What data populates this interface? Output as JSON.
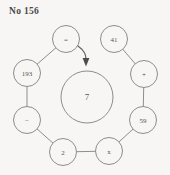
{
  "title": "No 156",
  "puzzle": {
    "center": {
      "label": "7",
      "cx": 87,
      "cy": 97,
      "r": 26
    },
    "nodes": [
      {
        "id": "equals",
        "label": "=",
        "cx": 66,
        "cy": 39,
        "r": 13.5
      },
      {
        "id": "n41",
        "label": "41",
        "cx": 114,
        "cy": 39,
        "r": 13.5
      },
      {
        "id": "plus",
        "label": "+",
        "cx": 144,
        "cy": 74,
        "r": 13.5
      },
      {
        "id": "n59",
        "label": "59",
        "cx": 143,
        "cy": 120,
        "r": 13.5
      },
      {
        "id": "times",
        "label": "x",
        "cx": 109,
        "cy": 151,
        "r": 13.5
      },
      {
        "id": "n2",
        "label": "2",
        "cx": 63,
        "cy": 152,
        "r": 13.5
      },
      {
        "id": "minus",
        "label": "−",
        "cx": 27,
        "cy": 120,
        "r": 13.5
      },
      {
        "id": "n193",
        "label": "193",
        "cx": 27,
        "cy": 73,
        "r": 13.5
      }
    ],
    "edges": [
      {
        "from": "n41",
        "to": "plus"
      },
      {
        "from": "plus",
        "to": "n59"
      },
      {
        "from": "n59",
        "to": "times"
      },
      {
        "from": "times",
        "to": "n2"
      },
      {
        "from": "n2",
        "to": "minus"
      },
      {
        "from": "minus",
        "to": "n193"
      },
      {
        "from": "n193",
        "to": "equals"
      }
    ],
    "arrow": {
      "from_node": "equals",
      "to_target": "center",
      "path": "M 78 46 C 85 51, 86 55, 86 60"
    },
    "colors": {
      "background": "#f7f6f4",
      "stroke": "#8e8d8c",
      "text": "#555452",
      "title": "#4a4a4a",
      "arrow": "#4d4c4a"
    }
  }
}
